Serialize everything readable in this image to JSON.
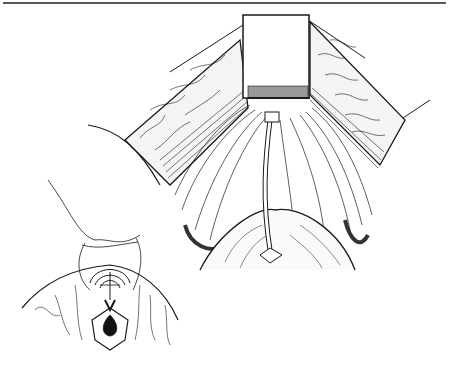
{
  "figure": {
    "type": "surgical-illustration",
    "style": "black-and-white line drawing",
    "main_view": "retracted surgical field with central retractor blade and tube",
    "inset_view": "perineal view with suture loop",
    "colors": {
      "ink": "#1a1a1a",
      "paper": "#ffffff"
    }
  }
}
